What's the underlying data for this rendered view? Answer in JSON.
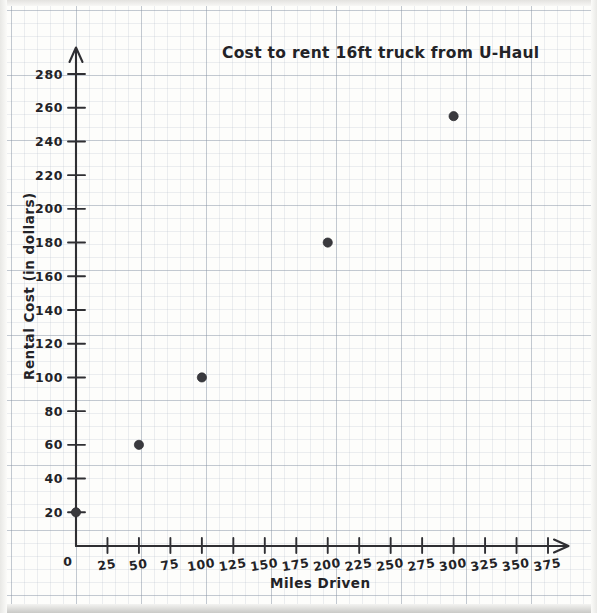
{
  "chart_data": {
    "type": "scatter",
    "title": "Cost to rent 16ft truck from U-Haul",
    "xlabel": "Miles Driven",
    "ylabel": "Rental Cost (in dollars)",
    "xlim": [
      0,
      390
    ],
    "ylim": [
      0,
      290
    ],
    "grid": true,
    "legend": "none",
    "style": "hand-drawn on graph paper",
    "x_ticks": [
      0,
      25,
      50,
      75,
      100,
      125,
      150,
      175,
      200,
      225,
      250,
      275,
      300,
      325,
      350,
      375
    ],
    "x_tick_labels": [
      "0",
      "25",
      "50",
      "75",
      "100",
      "125",
      "150",
      "175",
      "200",
      "225",
      "250",
      "275",
      "300",
      "325",
      "350",
      "375"
    ],
    "y_ticks": [
      0,
      20,
      40,
      60,
      80,
      100,
      120,
      140,
      160,
      180,
      200,
      220,
      240,
      260,
      280
    ],
    "y_tick_labels": [
      "0",
      "20",
      "40",
      "60",
      "80",
      "100",
      "120",
      "140",
      "160",
      "180",
      "200",
      "220",
      "240",
      "260",
      "280"
    ],
    "x": [
      0,
      50,
      100,
      200,
      300
    ],
    "values": [
      20,
      60,
      100,
      180,
      255
    ],
    "points": [
      {
        "x": 0,
        "y": 20
      },
      {
        "x": 50,
        "y": 60
      },
      {
        "x": 100,
        "y": 100
      },
      {
        "x": 200,
        "y": 180
      },
      {
        "x": 300,
        "y": 255
      }
    ],
    "marker_color": "#3a3a3e",
    "axis_color": "#2f2f33",
    "grid_color": "#8c96a5"
  }
}
